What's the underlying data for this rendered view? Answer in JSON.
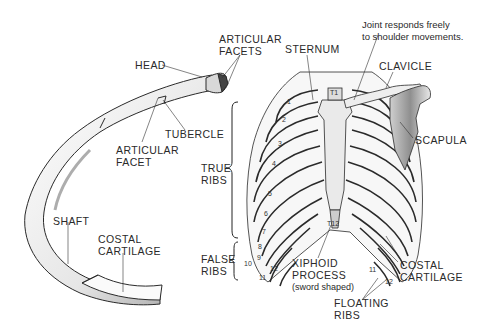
{
  "diagram": {
    "colors": {
      "ink": "#2a2a2a",
      "bone": "#f2f2f2",
      "shade": "#8a8a8a",
      "background": "#ffffff"
    }
  },
  "single_rib": {
    "labels": {
      "articular_facets": [
        "ARTICULAR",
        "FACETS"
      ],
      "head": "HEAD",
      "tubercle": "TUBERCLE",
      "articular_facet": [
        "ARTICULAR",
        "FACET"
      ],
      "shaft": "SHAFT",
      "costal_cartilage": [
        "COSTAL",
        "CARTILAGE"
      ]
    }
  },
  "rib_cage": {
    "labels": {
      "sternum": "STERNUM",
      "joint_note": [
        "Joint responds freely",
        "to shoulder movements."
      ],
      "clavicle": "CLAVICLE",
      "scapula": "SCAPULA",
      "true_ribs": [
        "TRUE",
        "RIBS"
      ],
      "false_ribs": [
        "FALSE",
        "RIBS"
      ],
      "xiphoid_process": [
        "XIPHOID",
        "PROCESS",
        "(sword shaped)"
      ],
      "costal_cartilage": [
        "COSTAL",
        "CARTILAGE"
      ],
      "floating_ribs": [
        "FLOATING",
        "RIBS"
      ]
    },
    "rib_numbers": {
      "left": [
        "1",
        "2",
        "3",
        "4",
        "5",
        "6",
        "7",
        "8",
        "9",
        "10",
        "11",
        "12"
      ],
      "right": [
        "11",
        "12"
      ],
      "sternal": [
        "T1",
        "T12"
      ]
    }
  }
}
